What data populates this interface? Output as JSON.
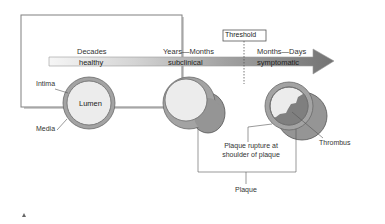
{
  "diagram": {
    "timeline": {
      "labels_top": [
        "Decades",
        "Years—Months",
        "Months—Days"
      ],
      "stages": [
        "healthy",
        "subclinical",
        "symptomatic"
      ],
      "threshold_label": "Threshold"
    },
    "vessel_labels": {
      "intima": "Intima",
      "media": "Media",
      "lumen": "Lumen"
    },
    "annotations": {
      "rupture_line1": "Plaque rupture at",
      "rupture_line2": "shoulder of plaque",
      "thrombus": "Thrombus",
      "plaque": "Plaque"
    },
    "colors": {
      "arrow_light": "#e6e6e6",
      "arrow_dark": "#7a7a7a",
      "vessel_wall": "#9a9a9a",
      "lumen": "#ececec",
      "plaque": "#8f8f8f",
      "thrombus": "#7d7d7d",
      "frame_border": "#7a7a7a"
    }
  }
}
